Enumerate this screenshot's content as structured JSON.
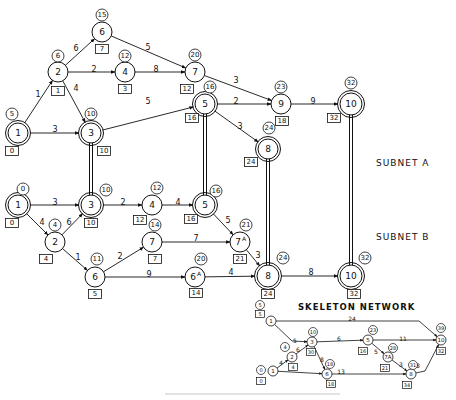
{
  "colors": {
    "ink": "#111111",
    "background": "#ffffff",
    "caption": "#dddddd"
  },
  "labels": {
    "subnet_a": "SUBNET A",
    "subnet_b": "SUBNET B",
    "skeleton": "SKELETON NETWORK"
  },
  "subnet_a": {
    "nodes": [
      {
        "id": "1",
        "x": 18,
        "y": 133,
        "r": 10,
        "double": true,
        "early": "5",
        "ex": 12,
        "ey": 114,
        "late": "0",
        "lx": 12,
        "ly": 151
      },
      {
        "id": "2",
        "x": 58,
        "y": 72,
        "r": 10,
        "double": false,
        "early": "6",
        "ex": 58,
        "ey": 56,
        "late": "1",
        "lx": 58,
        "ly": 91
      },
      {
        "id": "3",
        "x": 91,
        "y": 133,
        "r": 10,
        "double": true,
        "early": "10",
        "ex": 91,
        "ey": 114,
        "late": "10",
        "lx": 104,
        "ly": 151
      },
      {
        "id": "4",
        "x": 125,
        "y": 72,
        "r": 10,
        "double": false,
        "early": "12",
        "ex": 125,
        "ey": 56,
        "late": "3",
        "lx": 125,
        "ly": 89
      },
      {
        "id": "5",
        "x": 205,
        "y": 104,
        "r": 10,
        "double": true,
        "early": "16",
        "ex": 210,
        "ey": 87,
        "late": "16",
        "lx": 192,
        "ly": 118
      },
      {
        "id": "6",
        "x": 102,
        "y": 32,
        "r": 10,
        "double": false,
        "early": "15",
        "ex": 102,
        "ey": 15,
        "late": "7",
        "lx": 102,
        "ly": 49
      },
      {
        "id": "7",
        "x": 195,
        "y": 72,
        "r": 10,
        "double": false,
        "early": "20",
        "ex": 195,
        "ey": 55,
        "late": "12",
        "lx": 187,
        "ly": 89
      },
      {
        "id": "8",
        "x": 268,
        "y": 149,
        "r": 10,
        "double": true,
        "early": "24",
        "ex": 269,
        "ey": 128,
        "late": "24",
        "lx": 251,
        "ly": 162
      },
      {
        "id": "9",
        "x": 281,
        "y": 104,
        "r": 10,
        "double": false,
        "early": "23",
        "ex": 281,
        "ey": 87,
        "late": "18",
        "lx": 282,
        "ly": 121
      },
      {
        "id": "10",
        "x": 351,
        "y": 104,
        "r": 11,
        "double": true,
        "early": "32",
        "ex": 351,
        "ey": 83,
        "late": "32",
        "lx": 334,
        "ly": 118
      }
    ],
    "edges": [
      {
        "from": "1",
        "to": "2",
        "w": "1",
        "lx": 38,
        "ly": 94
      },
      {
        "from": "1",
        "to": "3",
        "w": "3",
        "lx": 55,
        "ly": 129
      },
      {
        "from": "2",
        "to": "6",
        "w": "6",
        "lx": 76,
        "ly": 48
      },
      {
        "from": "2",
        "to": "4",
        "w": "2",
        "lx": 94,
        "ly": 69
      },
      {
        "from": "2",
        "to": "3",
        "w": "4",
        "lx": 76,
        "ly": 88
      },
      {
        "from": "4",
        "to": "7",
        "w": "8",
        "lx": 156,
        "ly": 69
      },
      {
        "from": "6",
        "to": "7",
        "w": "5",
        "lx": 148,
        "ly": 47
      },
      {
        "from": "3",
        "to": "5",
        "w": "5",
        "lx": 148,
        "ly": 101
      },
      {
        "from": "7",
        "to": "9",
        "w": "3",
        "lx": 236,
        "ly": 80
      },
      {
        "from": "5",
        "to": "9",
        "w": "2",
        "lx": 236,
        "ly": 101
      },
      {
        "from": "5",
        "to": "8",
        "w": "3",
        "lx": 240,
        "ly": 126
      },
      {
        "from": "9",
        "to": "10",
        "w": "9",
        "lx": 313,
        "ly": 101
      }
    ]
  },
  "subnet_b": {
    "nodes": [
      {
        "id": "1",
        "x": 18,
        "y": 205,
        "r": 10,
        "double": true,
        "early": "0",
        "ex": 23,
        "ey": 189,
        "late": "0",
        "lx": 12,
        "ly": 223
      },
      {
        "id": "2",
        "x": 55,
        "y": 242,
        "r": 10,
        "double": false,
        "early": "4",
        "ex": 55,
        "ey": 225,
        "late": "4",
        "lx": 46,
        "ly": 259
      },
      {
        "id": "3",
        "x": 91,
        "y": 205,
        "r": 10,
        "double": true,
        "early": "10",
        "ex": 106,
        "ey": 190,
        "late": "10",
        "lx": 91,
        "ly": 223
      },
      {
        "id": "4",
        "x": 152,
        "y": 205,
        "r": 10,
        "double": false,
        "early": "12",
        "ex": 157,
        "ey": 188,
        "late": "12",
        "lx": 140,
        "ly": 220
      },
      {
        "id": "5",
        "x": 205,
        "y": 205,
        "r": 10,
        "double": true,
        "early": "16",
        "ex": 216,
        "ey": 191,
        "late": "16",
        "lx": 191,
        "ly": 219
      },
      {
        "id": "6",
        "x": 95,
        "y": 277,
        "r": 10,
        "double": false,
        "early": "11",
        "ex": 97,
        "ey": 259,
        "late": "5",
        "lx": 95,
        "ly": 294
      },
      {
        "id": "7",
        "x": 152,
        "y": 242,
        "r": 10,
        "double": false,
        "early": "14",
        "ex": 155,
        "ey": 225,
        "late": "7",
        "lx": 155,
        "ly": 259
      },
      {
        "id": "6A",
        "x": 195,
        "y": 277,
        "r": 10,
        "double": false,
        "early": "20",
        "ex": 201,
        "ey": 259,
        "late": "14",
        "lx": 196,
        "ly": 293
      },
      {
        "id": "7A",
        "x": 240,
        "y": 242,
        "r": 10,
        "double": false,
        "early": "21",
        "ex": 246,
        "ey": 225,
        "late": "21",
        "lx": 240,
        "ly": 259
      },
      {
        "id": "8",
        "x": 268,
        "y": 276,
        "r": 11,
        "double": true,
        "early": "24",
        "ex": 283,
        "ey": 258,
        "late": "24",
        "lx": 268,
        "ly": 294
      },
      {
        "id": "10",
        "x": 351,
        "y": 276,
        "r": 11,
        "double": true,
        "early": "32",
        "ex": 365,
        "ey": 258,
        "late": "32",
        "lx": 354,
        "ly": 294
      }
    ],
    "edges": [
      {
        "from": "1",
        "to": "3",
        "w": "3",
        "lx": 55,
        "ly": 202
      },
      {
        "from": "1",
        "to": "2",
        "w": "4",
        "lx": 42,
        "ly": 222
      },
      {
        "from": "2",
        "to": "3",
        "w": "6",
        "lx": 69,
        "ly": 222
      },
      {
        "from": "2",
        "to": "6",
        "w": "1",
        "lx": 78,
        "ly": 257
      },
      {
        "from": "3",
        "to": "4",
        "w": "2",
        "lx": 123,
        "ly": 202
      },
      {
        "from": "4",
        "to": "5",
        "w": "4",
        "lx": 178,
        "ly": 202
      },
      {
        "from": "6",
        "to": "7",
        "w": "2",
        "lx": 120,
        "ly": 256
      },
      {
        "from": "6",
        "to": "6A",
        "w": "9",
        "lx": 149,
        "ly": 274
      },
      {
        "from": "7",
        "to": "7A",
        "w": "7",
        "lx": 196,
        "ly": 238
      },
      {
        "from": "5",
        "to": "7A",
        "w": "5",
        "lx": 228,
        "ly": 220
      },
      {
        "from": "7A",
        "to": "8",
        "w": "3",
        "lx": 258,
        "ly": 255
      },
      {
        "from": "6A",
        "to": "8",
        "w": "4",
        "lx": 231,
        "ly": 272
      },
      {
        "from": "8",
        "to": "10",
        "w": "8",
        "lx": 311,
        "ly": 272
      }
    ]
  },
  "links": [
    {
      "x": 91,
      "y1": 143,
      "y2": 195
    },
    {
      "x": 205,
      "y1": 114,
      "y2": 195
    },
    {
      "x": 268,
      "y1": 159,
      "y2": 265
    },
    {
      "x": 351,
      "y1": 115,
      "y2": 265
    }
  ],
  "skeleton": {
    "nodes": [
      {
        "id": "1",
        "x": 271,
        "y": 321,
        "early": "5",
        "ex": 260,
        "ey": 305,
        "late": "5",
        "lx": 260,
        "ly": 314
      },
      {
        "id": "1b",
        "label": "1",
        "x": 273,
        "y": 371,
        "early": "0",
        "ex": 261,
        "ey": 370,
        "late": "0",
        "lx": 261,
        "ly": 381
      },
      {
        "id": "2",
        "x": 292,
        "y": 357,
        "early": "4",
        "ex": 285,
        "ey": 347,
        "late": "4",
        "lx": 293,
        "ly": 367
      },
      {
        "id": "3",
        "x": 312,
        "y": 342,
        "early": "10",
        "ex": 313,
        "ey": 332,
        "late": "30",
        "lx": 311,
        "ly": 352
      },
      {
        "id": "6",
        "x": 327,
        "y": 374,
        "early": "18",
        "ex": 330,
        "ey": 364,
        "late": "18",
        "lx": 331,
        "ly": 384
      },
      {
        "id": "5",
        "x": 368,
        "y": 340,
        "early": "23",
        "ex": 373,
        "ey": 330,
        "late": "16",
        "lx": 363,
        "ly": 351
      },
      {
        "id": "7A",
        "label": "7A",
        "x": 388,
        "y": 357,
        "early": "28",
        "ex": 393,
        "ey": 348,
        "late": "21",
        "lx": 385,
        "ly": 368
      },
      {
        "id": "8",
        "x": 411,
        "y": 374,
        "early": "31",
        "ex": 413,
        "ey": 365,
        "late": "34",
        "lx": 407,
        "ly": 385
      },
      {
        "id": "10",
        "x": 441,
        "y": 340,
        "early": "39",
        "ex": 441,
        "ey": 328,
        "late": "32",
        "lx": 441,
        "ly": 351
      }
    ],
    "edges": [
      {
        "from": "1",
        "to": "10",
        "w": "24",
        "lx": 352,
        "ly": 318,
        "bend": [
          419,
          321
        ]
      },
      {
        "from": "1",
        "to": "3",
        "w": "5",
        "lx": 295,
        "ly": 340,
        "bend": [
          292,
          341
        ]
      },
      {
        "from": "1b",
        "to": "2",
        "w": "4",
        "lx": 281,
        "ly": 362
      },
      {
        "from": "2",
        "to": "3",
        "w": "6",
        "lx": 298,
        "ly": 349
      },
      {
        "from": "1b",
        "to": "6",
        "w": "",
        "lx": 0,
        "ly": 0
      },
      {
        "from": "3",
        "to": "6",
        "w": "8",
        "lx": 322,
        "ly": 359
      },
      {
        "from": "3",
        "to": "5",
        "w": "6",
        "lx": 339,
        "ly": 338
      },
      {
        "from": "5",
        "to": "10",
        "w": "11",
        "lx": 403,
        "ly": 338
      },
      {
        "from": "5",
        "to": "7A",
        "w": "5",
        "lx": 376,
        "ly": 351
      },
      {
        "from": "7A",
        "to": "8",
        "w": "3",
        "lx": 401,
        "ly": 364
      },
      {
        "from": "6",
        "to": "8",
        "w": "13",
        "lx": 341,
        "ly": 371
      },
      {
        "from": "8",
        "to": "10",
        "w": "8",
        "lx": 418,
        "ly": 365,
        "bend": [
          425,
          371
        ]
      }
    ]
  }
}
